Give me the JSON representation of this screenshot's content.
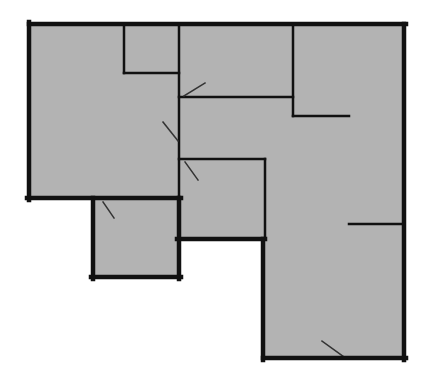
{
  "diagram": {
    "type": "floor-plan",
    "colors": {
      "background": "#ffffff",
      "floor": "#b3b3b3",
      "wall": "#111111",
      "door": "#333333"
    },
    "floor_outline": "29,24 404,24 404,358 263,358 263,239 179,239 179,277 93,277 93,198 29,198",
    "outer_walls": [
      {
        "id": "outer-top",
        "x1": 29,
        "y1": 24,
        "x2": 406,
        "y2": 24
      },
      {
        "id": "outer-right",
        "x1": 404,
        "y1": 24,
        "x2": 404,
        "y2": 360
      },
      {
        "id": "outer-bottom",
        "x1": 263,
        "y1": 358,
        "x2": 406,
        "y2": 358
      },
      {
        "id": "outer-left-lower-right",
        "x1": 263,
        "y1": 239,
        "x2": 263,
        "y2": 360
      },
      {
        "id": "outer-step-mid",
        "x1": 177,
        "y1": 239,
        "x2": 265,
        "y2": 239
      },
      {
        "id": "outer-step-lower-right",
        "x1": 179,
        "y1": 198,
        "x2": 179,
        "y2": 279
      },
      {
        "id": "outer-lower-left-bottom",
        "x1": 91,
        "y1": 277,
        "x2": 181,
        "y2": 277
      },
      {
        "id": "outer-lower-left-left",
        "x1": 93,
        "y1": 198,
        "x2": 93,
        "y2": 279
      },
      {
        "id": "outer-left-bottom",
        "x1": 27,
        "y1": 198,
        "x2": 181,
        "y2": 198
      },
      {
        "id": "outer-left",
        "x1": 29,
        "y1": 22,
        "x2": 29,
        "y2": 200
      }
    ],
    "inner_walls": [
      {
        "id": "closet-left",
        "x1": 124,
        "y1": 24,
        "x2": 124,
        "y2": 73
      },
      {
        "id": "closet-bottom",
        "x1": 124,
        "y1": 73,
        "x2": 179,
        "y2": 73
      },
      {
        "id": "spine-vertical",
        "x1": 179,
        "y1": 24,
        "x2": 179,
        "y2": 198
      },
      {
        "id": "upper-mid-bottom",
        "x1": 179,
        "y1": 97,
        "x2": 293,
        "y2": 97
      },
      {
        "id": "upper-right-left",
        "x1": 293,
        "y1": 24,
        "x2": 293,
        "y2": 116
      },
      {
        "id": "upper-right-bottom",
        "x1": 293,
        "y1": 116,
        "x2": 349,
        "y2": 116
      },
      {
        "id": "mid-room-top",
        "x1": 179,
        "y1": 159,
        "x2": 265,
        "y2": 159
      },
      {
        "id": "mid-room-right",
        "x1": 265,
        "y1": 159,
        "x2": 265,
        "y2": 239
      },
      {
        "id": "right-stub",
        "x1": 349,
        "y1": 224,
        "x2": 404,
        "y2": 224
      }
    ],
    "doors": [
      {
        "id": "door-upper-mid",
        "x1": 184,
        "y1": 96,
        "x2": 205,
        "y2": 83
      },
      {
        "id": "door-left-room",
        "x1": 163,
        "y1": 122,
        "x2": 178,
        "y2": 141
      },
      {
        "id": "door-mid-room",
        "x1": 185,
        "y1": 162,
        "x2": 198,
        "y2": 180
      },
      {
        "id": "door-lower-left-room",
        "x1": 103,
        "y1": 202,
        "x2": 114,
        "y2": 218
      },
      {
        "id": "door-entrance",
        "x1": 322,
        "y1": 341,
        "x2": 344,
        "y2": 357
      }
    ]
  }
}
